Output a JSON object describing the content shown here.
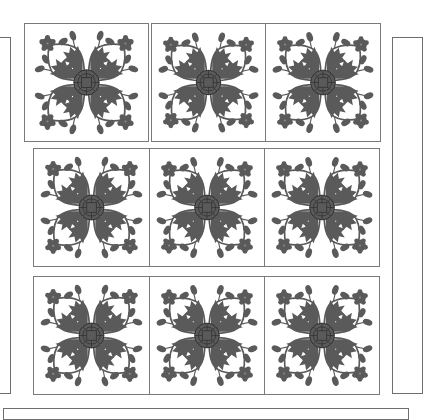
{
  "image": {
    "description": "Quilt layout diagram: 3x3 grid of appliqué floral blocks with side and bottom border strips",
    "colors": {
      "applique": "#5a5a5a",
      "outline": "#7a7a7a",
      "background": "#ffffff",
      "center_lines": "#2e2e2e"
    }
  },
  "quilt": {
    "rows": [
      {
        "blocks": [
          "applique-block",
          "applique-block",
          "applique-block"
        ]
      },
      {
        "blocks": [
          "applique-block",
          "applique-block",
          "applique-block"
        ]
      },
      {
        "blocks": [
          "applique-block",
          "applique-block",
          "applique-block"
        ]
      }
    ],
    "borders": [
      "left-border-strip",
      "right-border-strip",
      "bottom-border-strip"
    ]
  }
}
